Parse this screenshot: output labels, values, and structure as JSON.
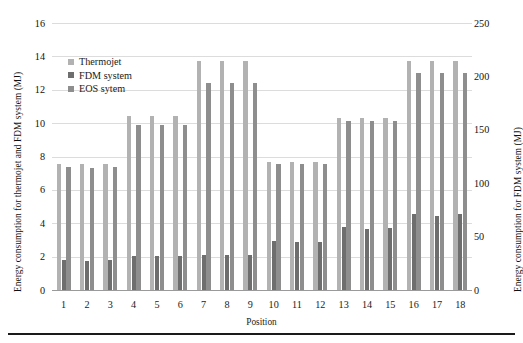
{
  "chart_data": {
    "type": "bar",
    "title": "",
    "xlabel": "Position",
    "ylabel": "Energy consumption for thermojet and FDM system (MJ)",
    "ylabel_secondary": "Energy consumption for FDM system (MJ)",
    "categories": [
      "1",
      "2",
      "3",
      "4",
      "5",
      "6",
      "7",
      "8",
      "9",
      "10",
      "11",
      "12",
      "13",
      "14",
      "15",
      "16",
      "17",
      "18"
    ],
    "ylim": [
      0,
      16
    ],
    "yticks": [
      0,
      2,
      4,
      6,
      8,
      10,
      12,
      14,
      16
    ],
    "ylim_secondary": [
      0,
      250
    ],
    "yticks_secondary": [
      0,
      50,
      100,
      150,
      200,
      250
    ],
    "grid": true,
    "legend_position": "upper-left-inside",
    "series": [
      {
        "name": "Thermojet",
        "axis": "left",
        "color": "#b2b2b2",
        "values": [
          7.55,
          7.55,
          7.55,
          10.4,
          10.4,
          10.4,
          13.7,
          13.7,
          13.7,
          7.7,
          7.7,
          7.7,
          10.3,
          10.3,
          10.3,
          13.7,
          13.7,
          13.7
        ]
      },
      {
        "name": "FDM system",
        "axis": "right",
        "color": "#6e6e6e",
        "values": [
          28,
          27,
          28,
          32,
          32,
          32,
          33,
          33,
          33,
          46,
          45,
          45,
          59,
          57,
          58,
          71,
          69,
          71
        ]
      },
      {
        "name": "EOS sytem",
        "axis": "left",
        "color": "#8e8e8e",
        "values": [
          7.35,
          7.3,
          7.35,
          9.9,
          9.9,
          9.9,
          12.4,
          12.4,
          12.4,
          7.55,
          7.55,
          7.55,
          10.1,
          10.1,
          10.1,
          13.0,
          13.0,
          13.0
        ]
      }
    ]
  }
}
